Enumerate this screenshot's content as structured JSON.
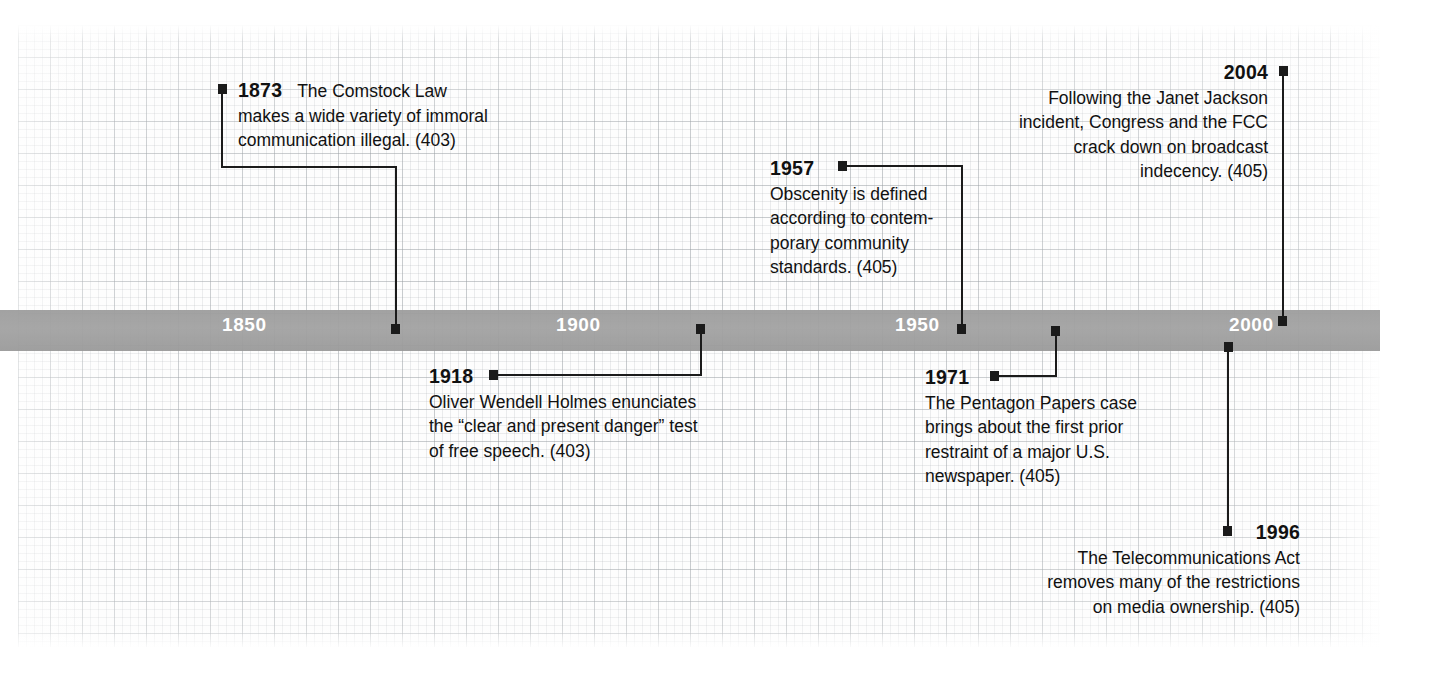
{
  "figure": {
    "kind": "timeline-infographic",
    "topic": "Milestones in U.S. media law, regulation, and free speech"
  },
  "axis": {
    "ticks": [
      "1850",
      "1900",
      "1950",
      "2000"
    ],
    "band_color": "#9e9e9e",
    "label_color": "#ffffff",
    "range": [
      "1825",
      "2010"
    ]
  },
  "theme": {
    "marker_color": "#1b1b1b",
    "text_color": "#111111",
    "background": "#ffffff",
    "grid_color": "#9aa0a5"
  },
  "events": [
    {
      "id": "e1873",
      "year": "1873",
      "position": "above",
      "align": "left",
      "page_ref": "(403)",
      "lines": [
        "The Comstock Law",
        "makes a wide variety of immoral",
        "communication illegal.  (403)"
      ],
      "text": "1873 The Comstock Law makes a wide variety of immoral communication illegal. (403)"
    },
    {
      "id": "e1918",
      "year": "1918",
      "position": "below",
      "align": "left",
      "page_ref": "(403)",
      "lines": [
        "Oliver Wendell Holmes enunciates",
        "the “clear and present danger” test",
        "of free speech. (403)"
      ],
      "text": "1918 Oliver Wendell Holmes enunciates the “clear and present danger” test of free speech. (403)"
    },
    {
      "id": "e1957",
      "year": "1957",
      "position": "above",
      "align": "left",
      "page_ref": "(405)",
      "lines": [
        "Obscenity is defined",
        "according to contem-",
        "porary community",
        "standards. (405)"
      ],
      "text": "1957 Obscenity is defined according to contemporary community standards. (405)"
    },
    {
      "id": "e1971",
      "year": "1971",
      "position": "below",
      "align": "left",
      "page_ref": "(405)",
      "lines": [
        "The Pentagon Papers case",
        "brings about the first prior",
        "restraint of a major U.S.",
        "newspaper. (405)"
      ],
      "text": "1971 The Pentagon Papers case brings about the first prior restraint of a major U.S. newspaper. (405)"
    },
    {
      "id": "e1996",
      "year": "1996",
      "position": "below",
      "align": "right",
      "page_ref": "(405)",
      "lines": [
        "The Telecommunications Act",
        "removes many of the restrictions",
        "on media ownership. (405)"
      ],
      "text": "1996 The Telecommunications Act removes many of the restrictions on media ownership. (405)"
    },
    {
      "id": "e2004",
      "year": "2004",
      "position": "above",
      "align": "right",
      "page_ref": "(405)",
      "lines": [
        "Following the Janet Jackson",
        "incident, Congress and the FCC",
        "crack down on broadcast",
        "indecency. (405)"
      ],
      "text": "2004 Following the Janet Jackson incident, Congress and the FCC crack down on broadcast indecency. (405)"
    }
  ]
}
